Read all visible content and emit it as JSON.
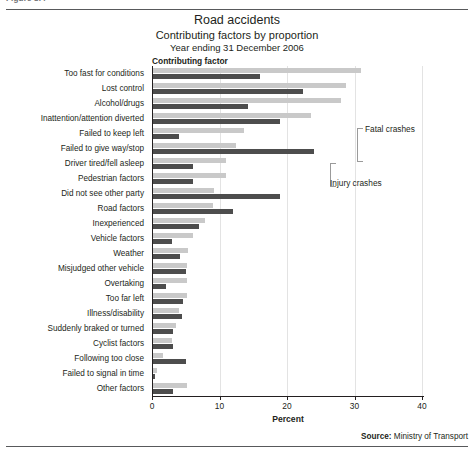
{
  "figure_caption": "Figure 8.4",
  "titles": {
    "main": "Road accidents",
    "sub": "Contributing factors by proportion",
    "period": "Year ending 31 December 2006"
  },
  "annotations": {
    "fatal": "Fatal crashes",
    "injury": "Injury crashes"
  },
  "source": {
    "label": "Source:",
    "value": "Ministry of Transport"
  },
  "chart_data": {
    "type": "bar",
    "orientation": "horizontal",
    "title": "Road accidents",
    "subtitle": "Contributing factors by proportion",
    "caption": "Year ending 31 December 2006",
    "xlabel": "Percent",
    "ylabel": "Contributing factor",
    "xlim": [
      0,
      40
    ],
    "xticks": [
      0,
      10,
      20,
      30,
      40
    ],
    "grid": true,
    "legend_position": "inline-annotation",
    "categories": [
      "Too fast for conditions",
      "Lost control",
      "Alcohol/drugs",
      "Inattention/attention diverted",
      "Failed to keep left",
      "Failed to give way/stop",
      "Driver tired/fell asleep",
      "Pedestrian factors",
      "Did not see other party",
      "Road factors",
      "Inexperienced",
      "Vehicle factors",
      "Weather",
      "Misjudged other vehicle",
      "Overtaking",
      "Too far left",
      "Illness/disability",
      "Suddenly braked or turned",
      "Cyclist factors",
      "Following too close",
      "Failed to signal in time",
      "Other factors"
    ],
    "series": [
      {
        "name": "Fatal crashes",
        "color": "#c9c9c9",
        "values": [
          31.0,
          28.7,
          28.0,
          23.5,
          13.6,
          12.5,
          11.0,
          11.0,
          9.2,
          9.0,
          7.8,
          6.0,
          5.3,
          5.2,
          5.2,
          5.2,
          4.0,
          3.6,
          3.0,
          1.6,
          0.7,
          5.2
        ]
      },
      {
        "name": "Injury crashes",
        "color": "#4d4d4d",
        "values": [
          16.0,
          22.3,
          14.2,
          19.0,
          4.0,
          24.0,
          6.0,
          6.0,
          19.0,
          12.0,
          7.0,
          3.0,
          4.1,
          5.0,
          2.0,
          4.6,
          4.4,
          3.1,
          3.1,
          5.0,
          0.5,
          3.1
        ]
      }
    ]
  }
}
